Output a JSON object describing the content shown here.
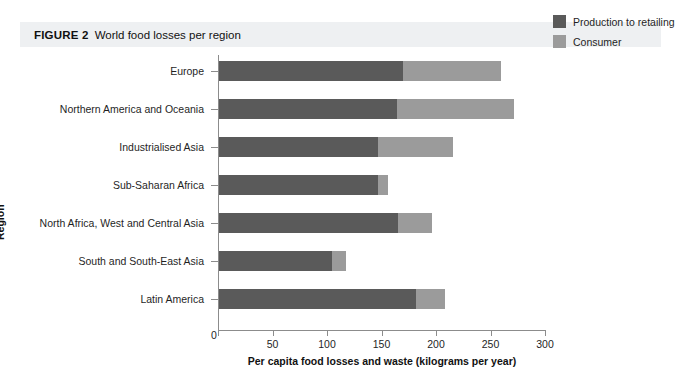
{
  "figure": {
    "number_label": "FIGURE 2",
    "title": "World food losses per region"
  },
  "colors": {
    "production_to_retailing": "#5a5a5a",
    "consumer": "#9b9b9b",
    "banner_background": "#eef0f2",
    "axis": "#8c8c8c"
  },
  "legend": {
    "position": "top-right",
    "items": [
      {
        "label": "Production to retailing",
        "color": "#5a5a5a"
      },
      {
        "label": "Consumer",
        "color": "#9b9b9b"
      }
    ]
  },
  "chart_data": {
    "type": "bar",
    "orientation": "horizontal",
    "stacked": true,
    "title": "World food losses per region",
    "xlabel": "Per capita food losses and waste (kilograms per year)",
    "ylabel": "Region",
    "xlim": [
      0,
      300
    ],
    "xticks": [
      0,
      50,
      100,
      150,
      200,
      250,
      300
    ],
    "xtick_labels": [
      "0",
      "50",
      "100",
      "150",
      "200",
      "250",
      "300"
    ],
    "grid": false,
    "categories": [
      "Europe",
      "Northern America and Oceania",
      "Industrialised Asia",
      "Sub-Saharan Africa",
      "North Africa, West and Central Asia",
      "South and South-East Asia",
      "Latin America"
    ],
    "series": [
      {
        "name": "Production to retailing",
        "color": "#5a5a5a",
        "values": [
          170,
          164,
          147,
          147,
          165,
          105,
          182
        ]
      },
      {
        "name": "Consumer",
        "color": "#9b9b9b",
        "values": [
          90,
          108,
          69,
          9,
          31,
          12,
          26
        ]
      }
    ],
    "totals": [
      260,
      272,
      216,
      156,
      196,
      117,
      208
    ]
  }
}
